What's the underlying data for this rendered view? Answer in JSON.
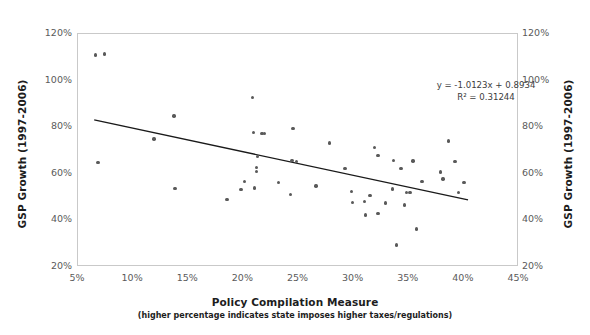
{
  "chart_data": {
    "type": "scatter",
    "title": "",
    "xlabel": "Policy Compilation Measure",
    "xsublabel": "(higher percentage indicates state imposes higher taxes/regulations)",
    "ylabel": "GSP Growth (1997-2006)",
    "ylabel_right": "GSP Growth (1997-2006)",
    "xlim": [
      5,
      45
    ],
    "ylim": [
      20,
      120
    ],
    "x_ticks": [
      "5%",
      "10%",
      "15%",
      "20%",
      "25%",
      "30%",
      "35%",
      "40%",
      "45%"
    ],
    "x_tick_values": [
      5,
      10,
      15,
      20,
      25,
      30,
      35,
      40,
      45
    ],
    "y_ticks": [
      "20%",
      "40%",
      "60%",
      "80%",
      "100%",
      "120%"
    ],
    "y_tick_values": [
      20,
      40,
      60,
      80,
      100,
      120
    ],
    "grid": false,
    "legend": "none",
    "marker_color": "#595959",
    "trendline_color": "#1a1a1a",
    "frame_color": "#c9c9c9",
    "annotation_equation": "y = -1.0123x + 0.8934",
    "annotation_r2": "R² = 0.31244",
    "trendline": {
      "slope": -1.0123,
      "intercept": 0.8934,
      "x_start": 6.4,
      "x_end": 40.6,
      "y_start": 82.8,
      "y_end": 48.2
    },
    "points": [
      {
        "x": 6.6,
        "y": 111.0
      },
      {
        "x": 7.4,
        "y": 111.5
      },
      {
        "x": 6.8,
        "y": 64.8
      },
      {
        "x": 11.9,
        "y": 75.0
      },
      {
        "x": 13.7,
        "y": 84.8
      },
      {
        "x": 13.8,
        "y": 53.8
      },
      {
        "x": 18.5,
        "y": 48.9
      },
      {
        "x": 19.8,
        "y": 53.2
      },
      {
        "x": 20.1,
        "y": 56.8
      },
      {
        "x": 20.8,
        "y": 92.8
      },
      {
        "x": 20.9,
        "y": 77.8
      },
      {
        "x": 21.0,
        "y": 53.9
      },
      {
        "x": 21.2,
        "y": 62.8
      },
      {
        "x": 21.2,
        "y": 60.9
      },
      {
        "x": 21.3,
        "y": 67.5
      },
      {
        "x": 21.7,
        "y": 77.2
      },
      {
        "x": 21.9,
        "y": 77.3
      },
      {
        "x": 23.2,
        "y": 56.3
      },
      {
        "x": 24.4,
        "y": 65.6
      },
      {
        "x": 24.5,
        "y": 79.4
      },
      {
        "x": 24.8,
        "y": 65.3
      },
      {
        "x": 24.3,
        "y": 51.2
      },
      {
        "x": 26.6,
        "y": 54.8
      },
      {
        "x": 27.8,
        "y": 73.2
      },
      {
        "x": 29.2,
        "y": 62.4
      },
      {
        "x": 29.8,
        "y": 52.5
      },
      {
        "x": 29.9,
        "y": 47.6
      },
      {
        "x": 31.0,
        "y": 48.1
      },
      {
        "x": 31.1,
        "y": 42.3
      },
      {
        "x": 31.5,
        "y": 50.6
      },
      {
        "x": 31.9,
        "y": 71.2
      },
      {
        "x": 32.2,
        "y": 67.8
      },
      {
        "x": 32.2,
        "y": 43.0
      },
      {
        "x": 32.9,
        "y": 47.5
      },
      {
        "x": 33.5,
        "y": 53.5
      },
      {
        "x": 33.6,
        "y": 65.8
      },
      {
        "x": 33.9,
        "y": 29.5
      },
      {
        "x": 34.3,
        "y": 62.2
      },
      {
        "x": 34.6,
        "y": 46.6
      },
      {
        "x": 34.8,
        "y": 51.9
      },
      {
        "x": 35.1,
        "y": 51.9
      },
      {
        "x": 35.4,
        "y": 65.5
      },
      {
        "x": 35.7,
        "y": 36.3
      },
      {
        "x": 36.2,
        "y": 56.7
      },
      {
        "x": 37.9,
        "y": 60.7
      },
      {
        "x": 38.1,
        "y": 57.7
      },
      {
        "x": 38.6,
        "y": 74.0
      },
      {
        "x": 39.2,
        "y": 65.2
      },
      {
        "x": 39.5,
        "y": 52.0
      },
      {
        "x": 40.0,
        "y": 56.2
      }
    ]
  }
}
